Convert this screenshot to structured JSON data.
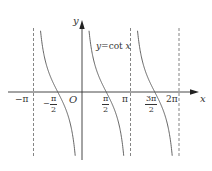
{
  "chart_data": {
    "type": "line",
    "title": "",
    "function_label": "y=cot x",
    "function_label_parts": {
      "y": "y",
      "eq": "=cot ",
      "x": "x"
    },
    "xlabel": "x",
    "ylabel": "y",
    "origin_label": "O",
    "x_range_radians": [
      -3.4,
      7.1
    ],
    "asymptotes": [
      "-π",
      "0",
      "π",
      "2π"
    ],
    "asymptote_style": "dashed",
    "zeros": [
      "-π/2",
      "π/2",
      "3π/2"
    ],
    "x_ticks": [
      {
        "label": "−π",
        "value": "-π"
      },
      {
        "label": "−π/2",
        "value": "-π/2",
        "sign": "−",
        "num": "π",
        "den": "2"
      },
      {
        "label": "O",
        "value": "0"
      },
      {
        "label": "π/2",
        "value": "π/2",
        "num": "π",
        "den": "2"
      },
      {
        "label": "π",
        "value": "π"
      },
      {
        "label": "3π/2",
        "value": "3π/2",
        "num": "3π",
        "den": "2"
      },
      {
        "label": "2π",
        "value": "2π"
      }
    ],
    "series": [
      {
        "name": "cot x, branch (-π, 0)",
        "domain": [
          "-π",
          "0"
        ]
      },
      {
        "name": "cot x, branch (0, π)",
        "domain": [
          "0",
          "π"
        ]
      },
      {
        "name": "cot x, branch (π, 2π)",
        "domain": [
          "π",
          "2π"
        ]
      }
    ],
    "grid": false,
    "legend": false,
    "colors": {
      "curve": "#555555",
      "axis": "#333333",
      "asymptote": "#666666"
    }
  }
}
